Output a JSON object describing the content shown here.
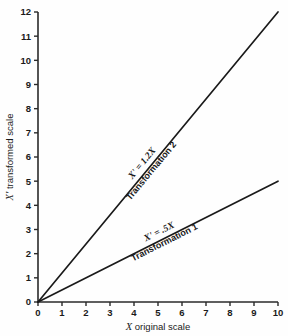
{
  "chart_data": {
    "type": "line",
    "title": "",
    "xlabel": "X original scale",
    "ylabel": "X' transformed scale",
    "xlim": [
      0,
      10
    ],
    "ylim": [
      0,
      12
    ],
    "grid": false,
    "legend": "inline-along-lines",
    "xticks": [
      "0",
      "1",
      "2",
      "3",
      "4",
      "5",
      "6",
      "7",
      "8",
      "9",
      "10"
    ],
    "yticks": [
      "0",
      "1",
      "2",
      "3",
      "4",
      "5",
      "6",
      "7",
      "8",
      "9",
      "10",
      "11",
      "12"
    ],
    "x": [
      0,
      10
    ],
    "series": [
      {
        "name": "Transformation 2",
        "formula": "X' = 1.2X",
        "slope": 1.2,
        "values": [
          0,
          12
        ],
        "color": "#1a1a1a"
      },
      {
        "name": "Transformation 1",
        "formula": "X' = .5X",
        "slope": 0.5,
        "values": [
          0,
          5
        ],
        "color": "#1a1a1a"
      }
    ]
  },
  "axes": {
    "x_title_symbol": "X",
    "x_title_rest": " original scale",
    "y_title_symbol": "X'",
    "y_title_rest": " transformed scale"
  },
  "labels": {
    "series2_formula": "X' = 1.2X",
    "series2_name": "Transformation 2",
    "series1_formula": "X' = .5X",
    "series1_name": "Transformation 1"
  },
  "ticks": {
    "x": [
      "0",
      "1",
      "2",
      "3",
      "4",
      "5",
      "6",
      "7",
      "8",
      "9",
      "10"
    ],
    "y": [
      "0",
      "1",
      "2",
      "3",
      "4",
      "5",
      "6",
      "7",
      "8",
      "9",
      "10",
      "11",
      "12"
    ]
  },
  "colors": {
    "line": "#1a1a1a",
    "axis": "#2a2a2a",
    "background": "#fefefe",
    "text": "#1a1a1a"
  }
}
